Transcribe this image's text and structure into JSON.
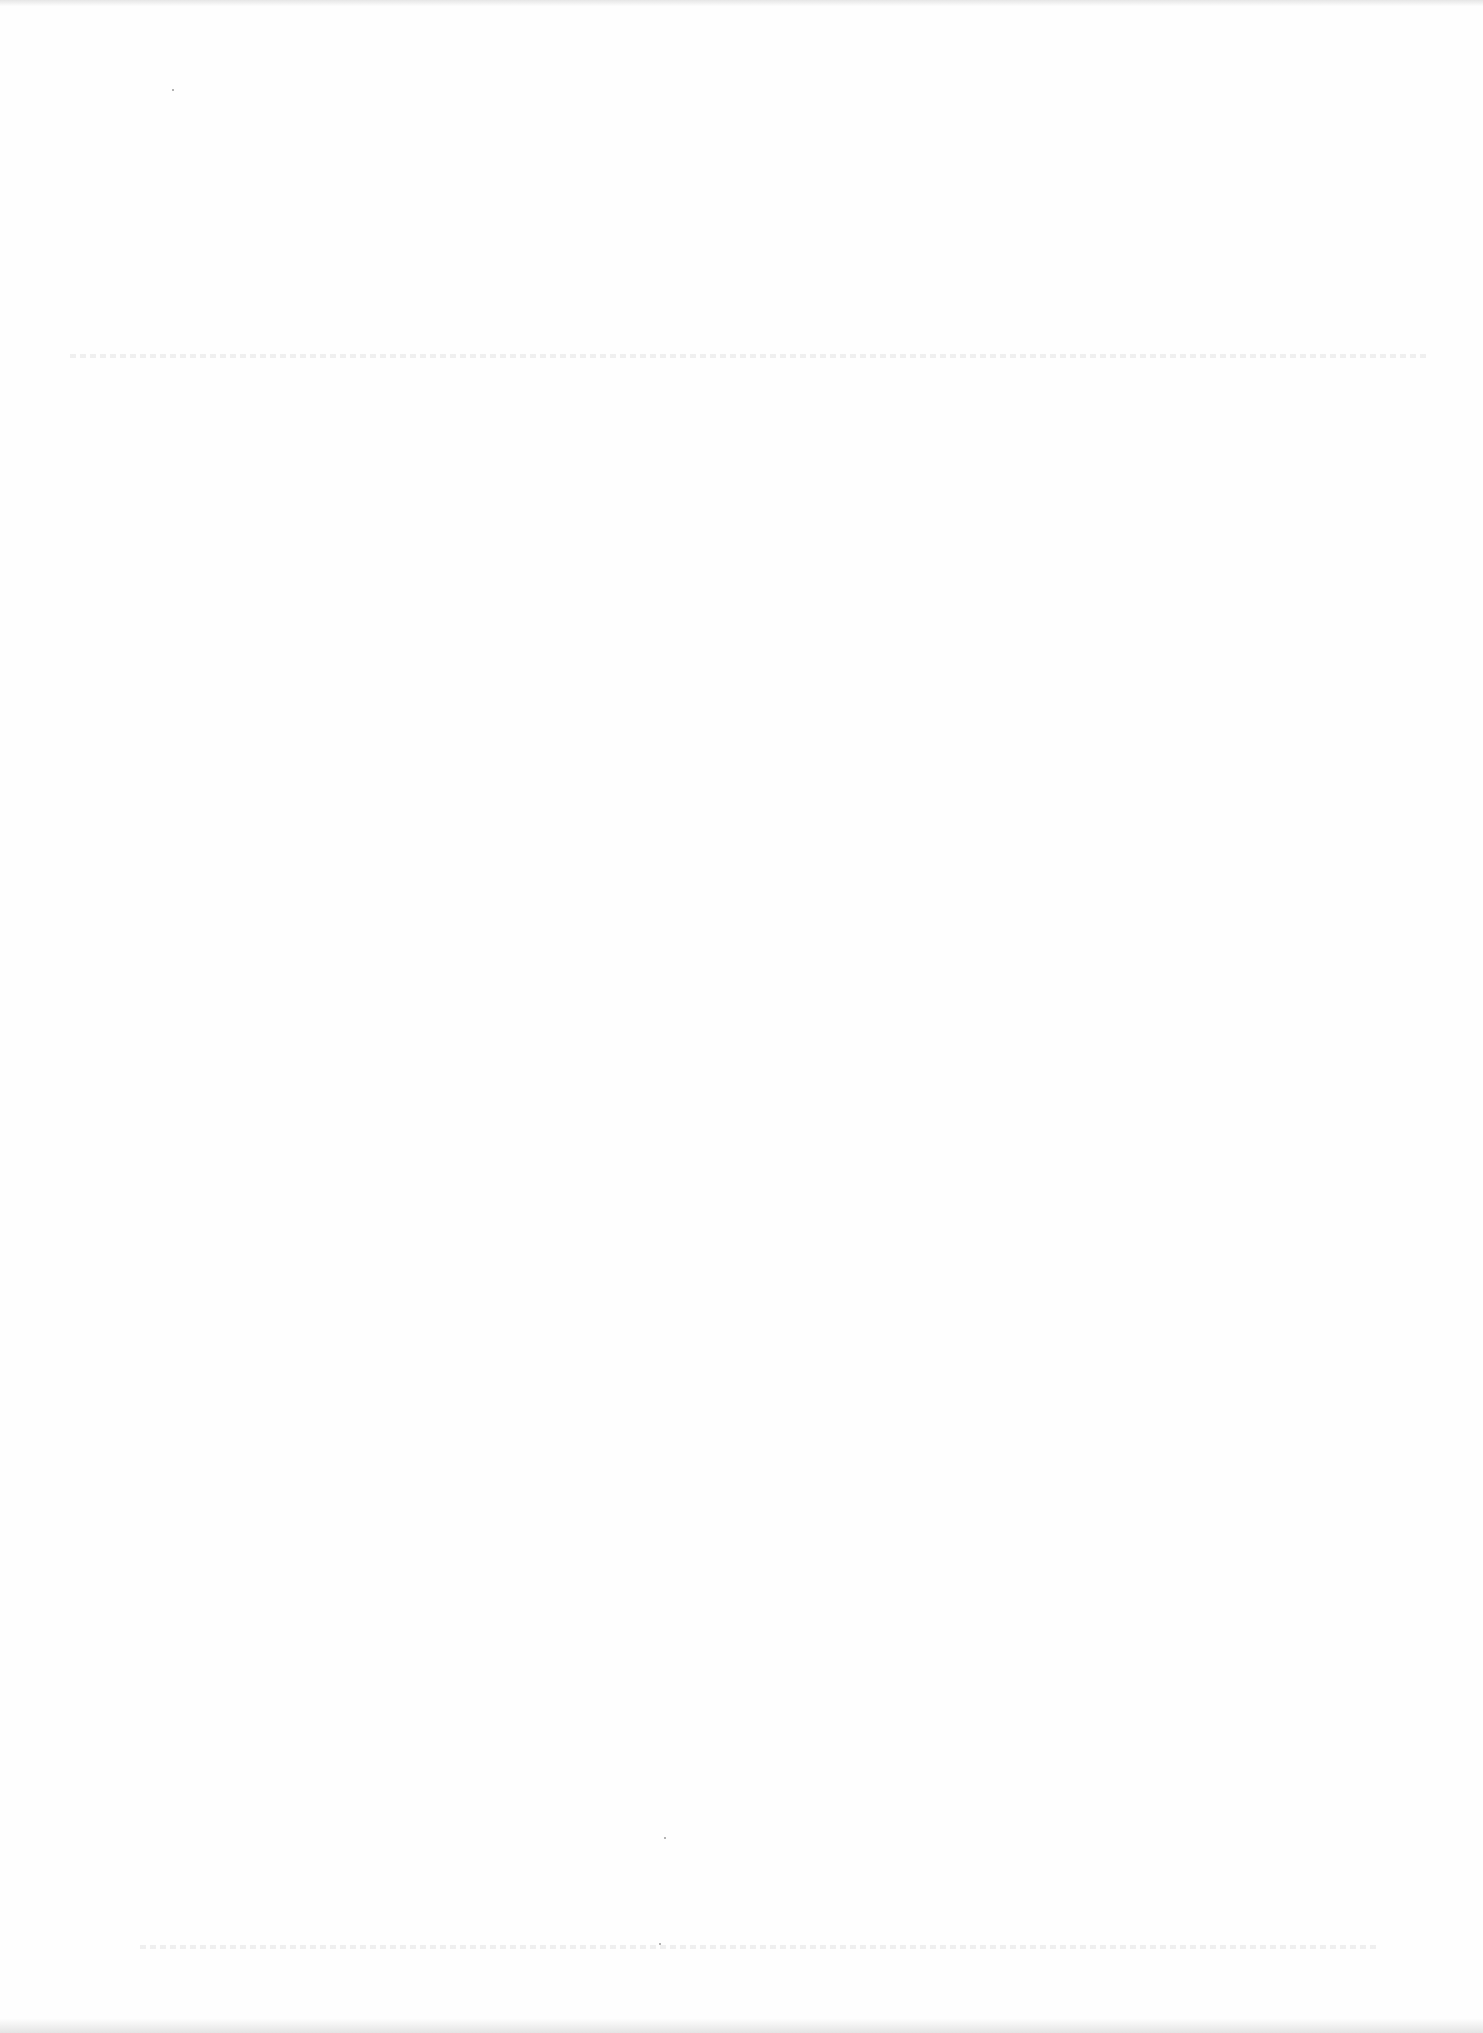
{
  "document": {
    "type": "scanned-page",
    "legible_text": "",
    "colors": {
      "paper": "#fefefe",
      "edge_shadow": "#e4e4e4",
      "faint_marks": "#e9e9e9"
    }
  }
}
